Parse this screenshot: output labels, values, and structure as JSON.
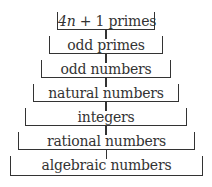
{
  "diagram": {
    "type": "nested-sets",
    "levels": [
      {
        "label": "4n + 1 primes",
        "box": [
          57,
          12,
          155,
          30
        ]
      },
      {
        "label": "odd primes",
        "box": [
          49,
          36,
          163,
          54
        ]
      },
      {
        "label": "odd numbers",
        "box": [
          41,
          60,
          171,
          78
        ]
      },
      {
        "label": "natural numbers",
        "box": [
          33,
          84,
          179,
          102
        ]
      },
      {
        "label": "integers",
        "box": [
          25,
          108,
          187,
          126
        ]
      },
      {
        "label": "rational numbers",
        "box": [
          18,
          132,
          195,
          150
        ]
      },
      {
        "label": "algebraic numbers",
        "box": [
          10,
          156,
          203,
          176
        ]
      }
    ]
  }
}
